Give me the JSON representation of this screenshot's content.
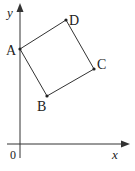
{
  "diagram": {
    "type": "coordinate-geometry",
    "axes": {
      "x_label": "x",
      "y_label": "y",
      "origin_label": "0"
    },
    "points": [
      {
        "name": "A",
        "label": "A"
      },
      {
        "name": "B",
        "label": "B"
      },
      {
        "name": "C",
        "label": "C"
      },
      {
        "name": "D",
        "label": "D"
      }
    ],
    "edges": [
      [
        "A",
        "B"
      ],
      [
        "B",
        "C"
      ],
      [
        "C",
        "D"
      ],
      [
        "D",
        "A"
      ]
    ],
    "colors": {
      "stroke": "#333333",
      "text": "#222222",
      "background": "#ffffff"
    }
  }
}
